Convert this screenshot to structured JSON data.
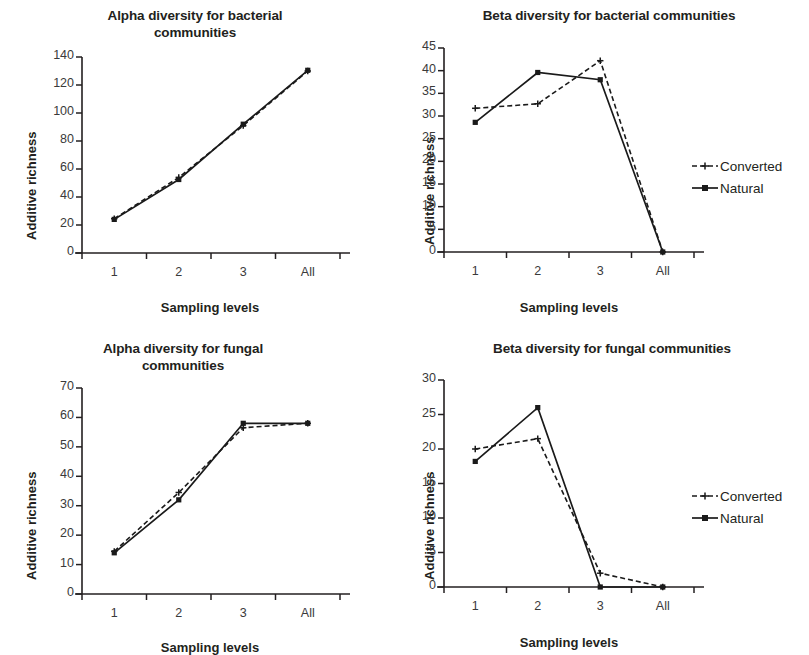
{
  "figure": {
    "axis_y_label": "Additive richness",
    "axis_x_label": "Sampling levels",
    "legend": {
      "converted": "Converted",
      "natural": "Natural"
    },
    "colors": {
      "line": "#1a1a1a",
      "text": "#231f20",
      "background": "#ffffff"
    }
  },
  "chart_data": [
    {
      "id": "alpha-bacterial",
      "type": "line",
      "title": "Alpha diversity for bacterial communities",
      "title_lines": [
        "Alpha diversity for bacterial",
        "communities"
      ],
      "xlabel": "Sampling levels",
      "ylabel": "Additive richness",
      "categories": [
        "1",
        "2",
        "3",
        "All"
      ],
      "yticks": [
        0,
        20,
        40,
        60,
        80,
        100,
        120,
        140
      ],
      "ylim": [
        0,
        140
      ],
      "grid": false,
      "legend_position": "none",
      "series": [
        {
          "name": "Converted",
          "style": "dashed",
          "marker": "plus",
          "values": [
            24.5,
            54,
            91,
            130
          ]
        },
        {
          "name": "Natural",
          "style": "solid",
          "marker": "square",
          "values": [
            24,
            52.5,
            92,
            130.5
          ]
        }
      ]
    },
    {
      "id": "beta-bacterial",
      "type": "line",
      "title": "Beta diversity for bacterial communities",
      "title_lines": [
        "Beta diversity for bacterial communities"
      ],
      "xlabel": "Sampling levels",
      "ylabel": "Additive richness",
      "categories": [
        "1",
        "2",
        "3",
        "All"
      ],
      "yticks": [
        0,
        5,
        10,
        15,
        20,
        25,
        30,
        35,
        40,
        45
      ],
      "ylim": [
        0,
        45
      ],
      "grid": false,
      "legend_position": "right",
      "series": [
        {
          "name": "Converted",
          "style": "dashed",
          "marker": "plus",
          "values": [
            31.7,
            32.7,
            42.2,
            0
          ]
        },
        {
          "name": "Natural",
          "style": "solid",
          "marker": "square",
          "values": [
            28.6,
            39.6,
            38.0,
            0
          ]
        }
      ]
    },
    {
      "id": "alpha-fungal",
      "type": "line",
      "title": "Alpha diversity for fungal communities",
      "title_lines": [
        "Alpha diversity for fungal",
        "communities"
      ],
      "xlabel": "Sampling levels",
      "ylabel": "Additive richness",
      "categories": [
        "1",
        "2",
        "3",
        "All"
      ],
      "yticks": [
        0,
        10,
        20,
        30,
        40,
        50,
        60,
        70
      ],
      "ylim": [
        0,
        70
      ],
      "grid": false,
      "legend_position": "none",
      "series": [
        {
          "name": "Converted",
          "style": "dashed",
          "marker": "plus",
          "values": [
            14.5,
            34.5,
            56.5,
            58
          ]
        },
        {
          "name": "Natural",
          "style": "solid",
          "marker": "square",
          "values": [
            14,
            32,
            58,
            58
          ]
        }
      ]
    },
    {
      "id": "beta-fungal",
      "type": "line",
      "title": "Beta diversity for fungal communities",
      "title_lines": [
        "Beta diversity for fungal communities"
      ],
      "xlabel": "Sampling levels",
      "ylabel": "Additive richness",
      "categories": [
        "1",
        "2",
        "3",
        "All"
      ],
      "yticks": [
        0,
        5,
        10,
        15,
        20,
        25,
        30
      ],
      "ylim": [
        0,
        30
      ],
      "grid": false,
      "legend_position": "right",
      "series": [
        {
          "name": "Converted",
          "style": "dashed",
          "marker": "plus",
          "values": [
            20,
            21.5,
            2,
            0
          ]
        },
        {
          "name": "Natural",
          "style": "solid",
          "marker": "square",
          "values": [
            18.2,
            26,
            0,
            0
          ]
        }
      ]
    }
  ]
}
